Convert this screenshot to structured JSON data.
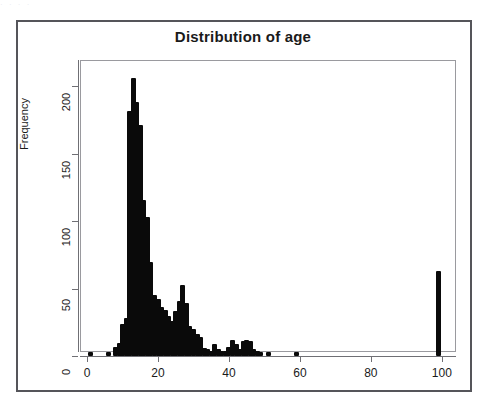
{
  "figure": {
    "title": "Distribution of age",
    "scan_artifact_text": "·   ·  ·        ·"
  },
  "chart_data": {
    "type": "bar",
    "title": "Distribution of age",
    "xlabel": "",
    "ylabel": "Frequency",
    "xlim": [
      -2,
      104
    ],
    "ylim": [
      0,
      215
    ],
    "grid": false,
    "legend": null,
    "x_ticks": [
      0,
      20,
      40,
      60,
      80,
      100
    ],
    "y_ticks": [
      0,
      50,
      100,
      150,
      200
    ],
    "x_tick_labels": [
      "0",
      "20",
      "40",
      "60",
      "80",
      "100"
    ],
    "y_tick_labels": [
      "0",
      "50",
      "100",
      "150",
      "200"
    ],
    "note": "Spike plot of age frequencies; narrow vertical bars at integer ages.",
    "x": [
      1,
      6,
      8,
      9,
      10,
      11,
      12,
      13,
      14,
      15,
      16,
      17,
      18,
      19,
      20,
      21,
      22,
      23,
      24,
      25,
      26,
      27,
      28,
      29,
      30,
      31,
      32,
      33,
      34,
      35,
      36,
      37,
      38,
      39,
      40,
      41,
      42,
      43,
      44,
      45,
      46,
      47,
      48,
      49,
      51,
      59,
      99
    ],
    "values": [
      3,
      3,
      7,
      10,
      24,
      28,
      182,
      206,
      188,
      171,
      116,
      103,
      70,
      45,
      42,
      36,
      34,
      30,
      26,
      33,
      41,
      53,
      39,
      22,
      20,
      16,
      14,
      6,
      5,
      4,
      9,
      5,
      4,
      4,
      7,
      12,
      9,
      5,
      11,
      12,
      11,
      5,
      4,
      3,
      3,
      3,
      63
    ]
  },
  "axes": {
    "y_title": "Frequency"
  }
}
